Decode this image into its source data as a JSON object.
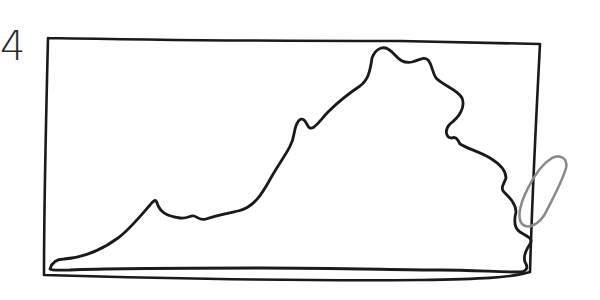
{
  "sketch": {
    "label": "4",
    "subject": "Hand-drawn outline of Virginia inside a rectangle frame",
    "colors": {
      "ink": "#1a1a1a",
      "oval": "#8a8a8a",
      "background": "#ffffff"
    }
  }
}
